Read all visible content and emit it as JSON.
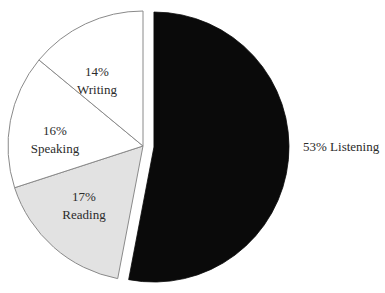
{
  "chart_data": {
    "type": "pie",
    "title": "",
    "subtitle": "",
    "xlabel": "",
    "ylabel": "",
    "legend_position": "none",
    "grid": false,
    "unit": "%",
    "total": 100,
    "categories": [
      "Listening",
      "Reading",
      "Speaking",
      "Writing"
    ],
    "values": [
      53,
      17,
      16,
      14
    ],
    "slices": [
      {
        "name": "Listening",
        "label_percent": "53%",
        "label_name": "Listening",
        "label_full": "53% Listening",
        "value": 53,
        "color": "#0a0a0a",
        "exploded": true,
        "label_placement": "outside-right"
      },
      {
        "name": "Reading",
        "label_percent": "17%",
        "label_name": "Reading",
        "label_full": "17% Reading",
        "value": 17,
        "color": "#e2e2e2",
        "exploded": false,
        "label_placement": "inside"
      },
      {
        "name": "Speaking",
        "label_percent": "16%",
        "label_name": "Speaking",
        "label_full": "16% Speaking",
        "value": 16,
        "color": "#ffffff",
        "exploded": false,
        "label_placement": "inside"
      },
      {
        "name": "Writing",
        "label_percent": "14%",
        "label_name": "Writing",
        "label_full": "14% Writing",
        "value": 14,
        "color": "#ffffff",
        "exploded": false,
        "label_placement": "inside"
      }
    ],
    "colors": {
      "background": "#ffffff",
      "outline": "#8a8a8a",
      "text": "#2b2b2b",
      "listening_fill": "#0a0a0a",
      "reading_fill": "#e2e2e2",
      "speaking_fill": "#ffffff",
      "writing_fill": "#ffffff"
    },
    "geometry": {
      "center_x": 143,
      "center_y": 146,
      "radius": 135,
      "start_angle_deg": -90,
      "direction": "clockwise",
      "explode_offset_px": 11
    }
  }
}
